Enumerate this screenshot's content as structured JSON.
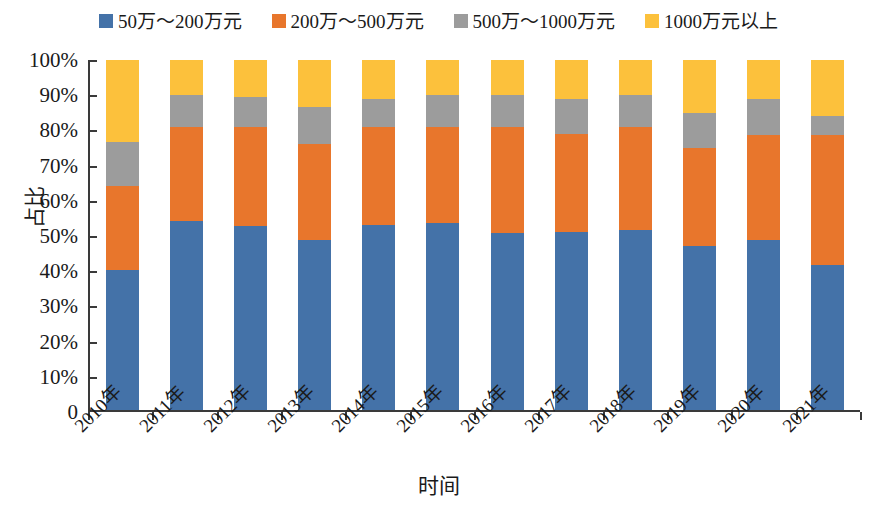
{
  "chart_data": {
    "type": "bar",
    "stacked": true,
    "stack_mode": "percent",
    "title": "",
    "xlabel": "时间",
    "ylabel": "占比",
    "ylim": [
      0,
      100
    ],
    "yticks": [
      0,
      10,
      20,
      30,
      40,
      50,
      60,
      70,
      80,
      90,
      100
    ],
    "ytick_labels": [
      "0",
      "10%",
      "20%",
      "30%",
      "40%",
      "50%",
      "60%",
      "70%",
      "80%",
      "90%",
      "100%"
    ],
    "grid": false,
    "legend_position": "top",
    "categories": [
      "2010年",
      "2011年",
      "2012年",
      "2013年",
      "2014年",
      "2015年",
      "2016年",
      "2017年",
      "2018年",
      "2019年",
      "2020年",
      "2021年"
    ],
    "series": [
      {
        "name": "50万～200万元",
        "color": "#4472a8",
        "values": [
          40,
          54,
          52.5,
          48.5,
          53,
          53.5,
          50.5,
          51,
          51.5,
          47,
          48.5,
          41.5
        ]
      },
      {
        "name": "200万～500万元",
        "color": "#e8762c",
        "values": [
          24,
          27,
          28.5,
          27.5,
          28,
          27.5,
          30.5,
          28,
          29.5,
          28,
          30,
          37
        ]
      },
      {
        "name": "500万～1000万元",
        "color": "#9c9c9c",
        "values": [
          12.5,
          9,
          8.5,
          10.5,
          8,
          9,
          9,
          10,
          9,
          10,
          10.5,
          5.5
        ]
      },
      {
        "name": "1000万元以上",
        "color": "#fcc13c",
        "values": [
          23.5,
          10,
          10.5,
          13.5,
          11,
          10,
          10,
          11,
          10,
          15,
          11,
          16
        ]
      }
    ]
  }
}
